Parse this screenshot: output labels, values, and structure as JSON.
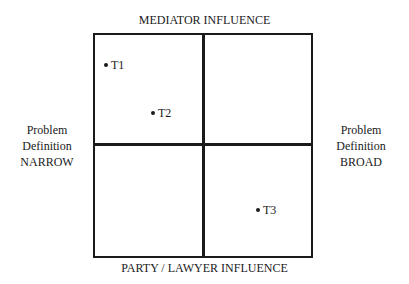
{
  "diagram": {
    "top_label": "MEDIATOR INFLUENCE",
    "bottom_label": "PARTY / LAWYER INFLUENCE",
    "left_label": [
      "Problem",
      "Definition",
      "NARROW"
    ],
    "right_label": [
      "Problem",
      "Definition",
      "BROAD"
    ],
    "points": [
      {
        "label": "T1"
      },
      {
        "label": "T2"
      },
      {
        "label": "T3"
      }
    ]
  }
}
